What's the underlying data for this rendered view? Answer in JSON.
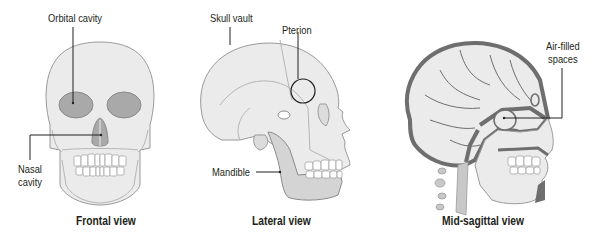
{
  "figure": {
    "panels": [
      {
        "id": "frontal",
        "caption": "Frontal view",
        "labels": [
          {
            "text": "Orbital cavity"
          },
          {
            "text": "Nasal\ncavity",
            "lines": [
              "Nasal",
              "cavity"
            ]
          }
        ]
      },
      {
        "id": "lateral",
        "caption": "Lateral view",
        "labels": [
          {
            "text": "Skull vault"
          },
          {
            "text": "Pterion"
          },
          {
            "text": "Mandible"
          }
        ]
      },
      {
        "id": "midsagittal",
        "caption": "Mid-sagittal view",
        "labels": [
          {
            "text": "Air-filled\nspaces",
            "lines": [
              "Air-filled",
              "spaces"
            ]
          }
        ]
      }
    ],
    "colors": {
      "bone": "#ebebeb",
      "bone_outline": "#9a9a9a",
      "cavity": "#a9a9a9",
      "dark_bone": "#6e6e6e",
      "leader": "#231f20",
      "text": "#231f20"
    }
  }
}
